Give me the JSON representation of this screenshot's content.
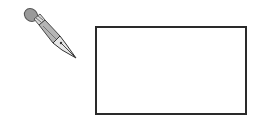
{
  "canvas": {
    "width": 260,
    "height": 123,
    "background": "#ffffff"
  },
  "tool": {
    "icon": "pen-icon",
    "color": "#9a9a9a"
  },
  "shape": {
    "type": "rectangle",
    "stroke_color": "#2a2a2a",
    "fill_color": "#ffffff"
  }
}
